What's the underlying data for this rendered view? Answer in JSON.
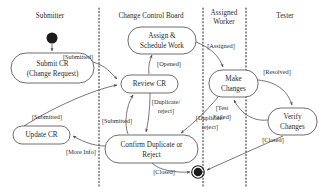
{
  "diagram": {
    "type": "uml-activity-swimlane",
    "width": 322,
    "height": 189,
    "colors": {
      "background": "#ffffff",
      "text": "#2b2b2b",
      "node_stroke": "#4a4a4a",
      "edge_stroke": "#555555",
      "divider": "#3a3a3a",
      "state_marker": "#1c1c1c"
    }
  },
  "lanes": [
    {
      "id": "submitter",
      "label": "Submitter",
      "label_x": 50,
      "label_y": 16,
      "x_start": 0,
      "x_end": 99
    },
    {
      "id": "ccb",
      "label": "Change Control Board",
      "label_x": 151,
      "label_y": 16,
      "x_start": 99,
      "x_end": 203
    },
    {
      "id": "assigned_worker",
      "label_line1": "Assigned",
      "label_line2": "Worker",
      "label": "Assigned Worker",
      "label_x": 224,
      "label_y": 12,
      "x_start": 203,
      "x_end": 246
    },
    {
      "id": "tester",
      "label": "Tester",
      "label_x": 285,
      "label_y": 16,
      "x_start": 246,
      "x_end": 322
    }
  ],
  "dividers": [
    {
      "id": "divider-1",
      "x": 99,
      "y1": 8,
      "y2": 186
    },
    {
      "id": "divider-2",
      "x": 203,
      "y1": 8,
      "y2": 186
    },
    {
      "id": "divider-3",
      "x": 246,
      "y1": 8,
      "y2": 186
    }
  ],
  "markers": {
    "initial_state": {
      "id": "initial-state",
      "cx": 52,
      "cy": 38,
      "r": 5.5
    },
    "final_state": {
      "id": "final-state",
      "cx": 198,
      "cy": 172,
      "r_outer": 6.5,
      "r_inner": 4.2
    }
  },
  "nodes": [
    {
      "id": "submit-cr",
      "lane": "submitter",
      "label_line1": "Submit CR",
      "label_line2": "(Change Request)",
      "label": "Submit CR (Change Request)",
      "x": 11,
      "y": 53,
      "w": 83,
      "h": 30,
      "rx": 15
    },
    {
      "id": "update-cr",
      "lane": "submitter",
      "label_line1": "Update  CR",
      "label": "Update CR",
      "x": 13,
      "y": 126,
      "w": 57,
      "h": 18,
      "rx": 9
    },
    {
      "id": "assign-schedule-work",
      "lane": "ccb",
      "label_line1": "Assign &",
      "label_line2": "Schedule Work",
      "label": "Assign & Schedule Work",
      "x": 128,
      "y": 27,
      "w": 68,
      "h": 27,
      "rx": 13
    },
    {
      "id": "review-cr",
      "lane": "ccb",
      "label_line1": "Review CR",
      "label": "Review CR",
      "x": 121,
      "y": 75,
      "w": 57,
      "h": 18,
      "rx": 9
    },
    {
      "id": "confirm-duplicate-or-reject",
      "lane": "ccb",
      "label_line1": "Confirm Duplicate or",
      "label_line2": "Reject",
      "label": "Confirm Duplicate or Reject",
      "x": 105,
      "y": 135,
      "w": 93,
      "h": 28,
      "rx": 14
    },
    {
      "id": "make-changes",
      "lane": "assigned_worker",
      "label_line1": "Make",
      "label_line2": "Changes",
      "label": "Make Changes",
      "x": 209,
      "y": 70,
      "w": 49,
      "h": 27,
      "rx": 13
    },
    {
      "id": "verify-changes",
      "lane": "tester",
      "label_line1": "Verify",
      "label_line2": "Changes",
      "label": "Verify Changes",
      "x": 268,
      "y": 108,
      "w": 49,
      "h": 27,
      "rx": 13
    }
  ],
  "transitions": [
    {
      "id": "t-start-submit",
      "from": "initial-state",
      "to": "submit-cr",
      "guard": "",
      "path": "M 52 44 L 52 52"
    },
    {
      "id": "t-submitted-review",
      "from": "submit-cr",
      "to": "review-cr",
      "guard": "[Submitted]",
      "guard_x": 78,
      "guard_y": 58,
      "path": "M 93 62 C 106 66 110 72 118 80"
    },
    {
      "id": "t-opened-assign",
      "from": "review-cr",
      "to": "assign-schedule-work",
      "guard": "[Opened]",
      "guard_x": 166,
      "guard_y": 65,
      "path": "M 149 74 C 148 66 150 60 152 55"
    },
    {
      "id": "t-assigned-make-changes",
      "from": "assign-schedule-work",
      "to": "make-changes",
      "guard": "[Assigned]",
      "guard_x": 218,
      "guard_y": 47,
      "path": "M 196 42 C 210 48 218 56 223 68"
    },
    {
      "id": "t-resolved-verify",
      "from": "make-changes",
      "to": "verify-changes",
      "guard": "[Resolved]",
      "guard_x": 276,
      "guard_y": 73,
      "path": "M 258 80 C 278 82 288 92 292 106"
    },
    {
      "id": "t-test-failed-make-changes",
      "from": "verify-changes",
      "to": "make-changes",
      "guard_line1": "[Test",
      "guard_line2": "Failed]",
      "guard": "[Test Failed]",
      "guard_x": 222,
      "guard_y": 112,
      "path": "M 268 120 C 250 122 238 110 234 99"
    },
    {
      "id": "t-closed-final",
      "from": "verify-changes",
      "to": "final-state",
      "guard": "[Closed]",
      "guard_x": 272,
      "guard_y": 139,
      "path": "M 283 136 L 206 170"
    },
    {
      "id": "t-duplicate-reject-left",
      "from": "review-cr",
      "to": "confirm-duplicate-or-reject",
      "guard_line1": "[Duplicate/",
      "guard_line2": "reject]",
      "guard": "[Duplicate/reject]",
      "guard_x": 164,
      "guard_y": 106,
      "path": "M 150 93 C 150 110 148 124 146 133"
    },
    {
      "id": "t-duplicate-reject-right",
      "from": "make-changes",
      "to": "confirm-duplicate-or-reject",
      "guard_line1": "[Duplicate/",
      "guard_line2": "reject]",
      "guard": "[Duplicate/reject]",
      "guard_x": 207,
      "guard_y": 120,
      "path": "M 218 97 C 206 112 190 126 180 133"
    },
    {
      "id": "t-submitted-confirm-review",
      "from": "confirm-duplicate-or-reject",
      "to": "review-cr",
      "guard": "[Submitted]",
      "guard_x": 118,
      "guard_y": 122,
      "path": "M 128 134 C 124 124 126 106 133 94"
    },
    {
      "id": "t-more-info-update",
      "from": "confirm-duplicate-or-reject",
      "to": "update-cr",
      "guard": "[More Info]",
      "guard_x": 80,
      "guard_y": 152,
      "path": "M 105 146 C 92 146 80 140 72 136"
    },
    {
      "id": "t-submitted-update-review",
      "from": "update-cr",
      "to": "review-cr",
      "guard": "[Submitted]",
      "guard_x": 47,
      "guard_y": 118,
      "path": "M 24 126 C 52 108 92 90 118 85"
    },
    {
      "id": "t-closed-confirm-final",
      "from": "confirm-duplicate-or-reject",
      "to": "final-state",
      "guard": "[Closed]",
      "guard_x": 164,
      "guard_y": 172,
      "path": "M 152 163 C 158 170 176 173 190 172"
    }
  ]
}
